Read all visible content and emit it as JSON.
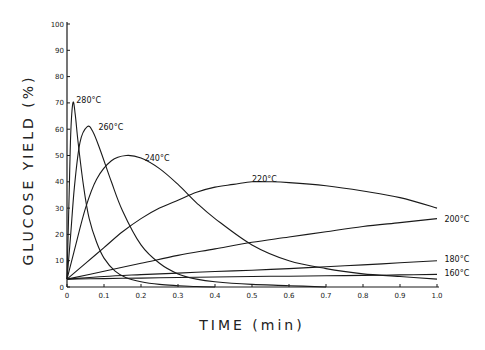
{
  "chart_data": {
    "type": "line",
    "title": "",
    "xlabel": "TIME (min)",
    "ylabel": "GLUCOSE YIELD (%)",
    "xlim": [
      0,
      1.0
    ],
    "ylim": [
      0,
      100
    ],
    "grid": false,
    "legend": "inline curve labels",
    "x_ticks": [
      "0",
      "0.1",
      "0.2",
      "0.3",
      "0.4",
      "0.5",
      "0.6",
      "0.7",
      "0.8",
      "0.9",
      "1.0"
    ],
    "y_ticks": [
      "0",
      "10",
      "20",
      "30",
      "40",
      "50",
      "60",
      "70",
      "80",
      "90",
      "100"
    ],
    "series": [
      {
        "name": "280°C",
        "x": [
          0,
          0.005,
          0.01,
          0.016,
          0.022,
          0.03,
          0.045,
          0.06,
          0.08,
          0.1,
          0.13,
          0.16,
          0.2,
          0.25,
          0.3,
          0.35,
          0.4
        ],
        "y": [
          3,
          30,
          58,
          70,
          66,
          55,
          38,
          26,
          17,
          11,
          6,
          3.5,
          2,
          1,
          0.5,
          0.2,
          0
        ]
      },
      {
        "name": "260°C",
        "x": [
          0,
          0.01,
          0.02,
          0.035,
          0.055,
          0.07,
          0.09,
          0.12,
          0.15,
          0.2,
          0.25,
          0.3,
          0.35,
          0.4,
          0.5,
          0.6,
          0.7
        ],
        "y": [
          3,
          20,
          38,
          55,
          61,
          59,
          52,
          40,
          29,
          16,
          9,
          5,
          3,
          2,
          1,
          0.5,
          0
        ]
      },
      {
        "name": "240°C",
        "x": [
          0,
          0.02,
          0.05,
          0.08,
          0.12,
          0.16,
          0.2,
          0.25,
          0.3,
          0.35,
          0.4,
          0.5,
          0.6,
          0.7,
          0.8,
          0.9,
          1.0
        ],
        "y": [
          3,
          14,
          30,
          41,
          48,
          50,
          49,
          45,
          39,
          32,
          26,
          16,
          10,
          7,
          5,
          4,
          3
        ]
      },
      {
        "name": "220°C",
        "x": [
          0,
          0.05,
          0.1,
          0.15,
          0.2,
          0.25,
          0.3,
          0.35,
          0.4,
          0.45,
          0.5,
          0.55,
          0.6,
          0.7,
          0.8,
          0.9,
          1.0
        ],
        "y": [
          3,
          9,
          15,
          21,
          26,
          30,
          33,
          36,
          38,
          39,
          40,
          40,
          39.7,
          38.5,
          36.5,
          34,
          30
        ]
      },
      {
        "name": "200°C",
        "x": [
          0,
          0.1,
          0.2,
          0.3,
          0.4,
          0.5,
          0.6,
          0.7,
          0.8,
          0.9,
          1.0
        ],
        "y": [
          3,
          6,
          9,
          12,
          14.5,
          17,
          19,
          21,
          23,
          24.5,
          26
        ]
      },
      {
        "name": "180°C",
        "x": [
          0,
          0.1,
          0.2,
          0.3,
          0.4,
          0.5,
          0.6,
          0.7,
          0.8,
          0.9,
          1.0
        ],
        "y": [
          3,
          4,
          4.7,
          5.3,
          5.9,
          6.4,
          7,
          7.7,
          8.4,
          9.2,
          10
        ]
      },
      {
        "name": "160°C",
        "x": [
          0,
          0.1,
          0.2,
          0.3,
          0.4,
          0.5,
          0.6,
          0.7,
          0.8,
          0.9,
          1.0
        ],
        "y": [
          3,
          3.2,
          3.4,
          3.6,
          3.8,
          4,
          4.1,
          4.3,
          4.4,
          4.6,
          4.8
        ]
      }
    ],
    "annotations": [
      {
        "text": "280°C",
        "x": 0.025,
        "y": 71
      },
      {
        "text": "260°C",
        "x": 0.085,
        "y": 61
      },
      {
        "text": "240°C",
        "x": 0.21,
        "y": 49
      },
      {
        "text": "220°C",
        "x": 0.5,
        "y": 41
      },
      {
        "text": "200°C",
        "x": 1.02,
        "y": 26
      },
      {
        "text": "180°C",
        "x": 1.02,
        "y": 10.5
      },
      {
        "text": "160°C",
        "x": 1.02,
        "y": 5.5
      }
    ]
  },
  "layout": {
    "plot": {
      "x0": 67,
      "x1": 437,
      "y0": 287,
      "y1": 24
    },
    "line_color": "#1a1a1a"
  }
}
